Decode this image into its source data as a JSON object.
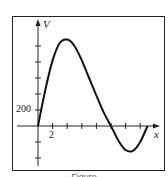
{
  "chart_data": {
    "type": "line",
    "title": "",
    "xlabel": "x",
    "ylabel": "V",
    "x_tick_labels": [
      "2"
    ],
    "y_tick_labels": [
      "200"
    ],
    "x_tick_step": 2,
    "y_tick_step": 200,
    "xlim": [
      0,
      16
    ],
    "ylim": [
      -600,
      1200
    ],
    "grid": false,
    "legend": null,
    "series": [
      {
        "name": "V(x)",
        "x": [
          0,
          1,
          2,
          3,
          4,
          5,
          6,
          7,
          8,
          9,
          10,
          11,
          12,
          13,
          14,
          15
        ],
        "values": [
          0,
          450,
          820,
          1040,
          1080,
          1000,
          820,
          600,
          380,
          170,
          0,
          -180,
          -300,
          -310,
          -200,
          0
        ]
      }
    ],
    "annotations": []
  },
  "caption": "Figure"
}
